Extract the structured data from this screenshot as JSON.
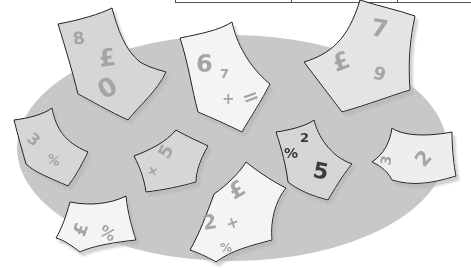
{
  "illustration": {
    "background_color": "#ffffff",
    "ellipse_color": "#c8c8c8",
    "paper_light": "#f4f4f4",
    "paper_mid": "#d6d6d6",
    "glyph_color": "#a5a5a5",
    "dark_glyph_color": "#3a3a3a",
    "notes": [
      {
        "id": "note-1",
        "glyphs": [
          "8",
          "£",
          "0"
        ]
      },
      {
        "id": "note-2",
        "glyphs": [
          "6",
          "7",
          "+",
          "="
        ]
      },
      {
        "id": "note-3",
        "glyphs": [
          "7",
          "£",
          "9"
        ]
      },
      {
        "id": "note-4",
        "glyphs": [
          "3",
          "%"
        ]
      },
      {
        "id": "note-5",
        "glyphs": [
          "+",
          "5"
        ]
      },
      {
        "id": "note-6",
        "glyphs": [
          "%",
          "2",
          "5"
        ]
      },
      {
        "id": "note-7",
        "glyphs": [
          "3",
          "2"
        ]
      },
      {
        "id": "note-8",
        "glyphs": [
          "£",
          "%"
        ]
      },
      {
        "id": "note-9",
        "glyphs": [
          "£",
          "2",
          "+",
          "%"
        ]
      }
    ]
  }
}
